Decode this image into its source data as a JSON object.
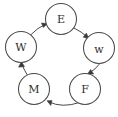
{
  "diagram": {
    "type": "directed-cycle",
    "background_color": "#ffffff",
    "stroke_color": "#4a4a4a",
    "label_color": "#2e2e2e",
    "node_radius": 15.5,
    "nodes": [
      {
        "id": "E",
        "label": "E",
        "cx": 61,
        "cy": 19,
        "name": "node-e"
      },
      {
        "id": "w",
        "label": "w",
        "cx": 99,
        "cy": 48,
        "name": "node-w-lower"
      },
      {
        "id": "F",
        "label": "F",
        "cx": 85,
        "cy": 89,
        "name": "node-f"
      },
      {
        "id": "M",
        "label": "M",
        "cx": 34,
        "cy": 89,
        "name": "node-m"
      },
      {
        "id": "W",
        "label": "W",
        "cx": 21,
        "cy": 47,
        "name": "node-w-upper"
      }
    ],
    "edges": [
      {
        "from": "E",
        "to": "w",
        "name": "edge-e-to-w-lower"
      },
      {
        "from": "w",
        "to": "F",
        "name": "edge-w-lower-to-f"
      },
      {
        "from": "F",
        "to": "M",
        "name": "edge-f-to-m"
      },
      {
        "from": "M",
        "to": "W",
        "name": "edge-m-to-w-upper"
      },
      {
        "from": "W",
        "to": "E",
        "name": "edge-w-upper-to-e"
      }
    ]
  }
}
